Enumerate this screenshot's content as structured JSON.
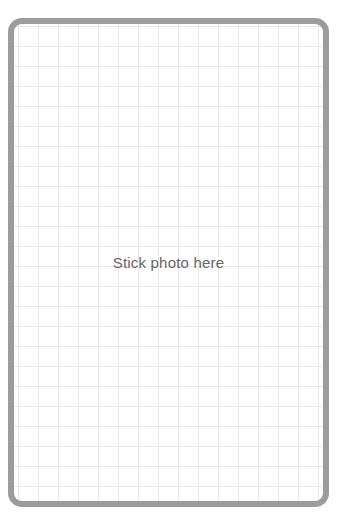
{
  "photo_placeholder": {
    "label": "Stick photo here",
    "border_color": "#9c9c9c",
    "grid_color": "#e9e9e9"
  }
}
